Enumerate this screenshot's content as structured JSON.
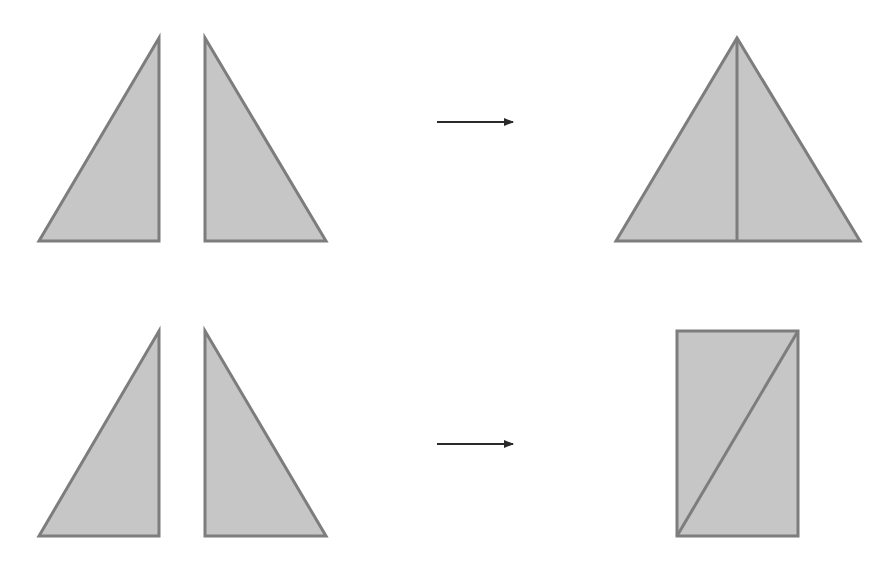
{
  "diagram": {
    "title": "",
    "colors": {
      "background": "#ffffff",
      "fill": "#c6c6c6",
      "stroke": "#7d7d7d",
      "arrow": "#2a2a2a"
    },
    "rows": [
      {
        "name": "row-isosceles",
        "inputs": [
          {
            "name": "left-right-triangle",
            "points": [
              [
                39,
                241
              ],
              [
                159,
                241
              ],
              [
                159,
                38
              ]
            ]
          },
          {
            "name": "right-right-triangle",
            "points": [
              [
                205,
                38
              ],
              [
                205,
                241
              ],
              [
                326,
                241
              ]
            ]
          }
        ],
        "arrow": {
          "x1": 437,
          "y1": 122,
          "x2": 513,
          "y2": 122
        },
        "output": {
          "name": "combined-isosceles-triangle",
          "polygon": [
            [
              616,
              241
            ],
            [
              737,
              38
            ],
            [
              860,
              241
            ]
          ],
          "inner_lines": [
            [
              [
                737,
                38
              ],
              [
                737,
                241
              ]
            ]
          ]
        }
      },
      {
        "name": "row-rectangle",
        "inputs": [
          {
            "name": "left-right-triangle",
            "points": [
              [
                39,
                536
              ],
              [
                159,
                536
              ],
              [
                159,
                331
              ]
            ]
          },
          {
            "name": "right-right-triangle",
            "points": [
              [
                205,
                331
              ],
              [
                205,
                536
              ],
              [
                326,
                536
              ]
            ]
          }
        ],
        "arrow": {
          "x1": 437,
          "y1": 444,
          "x2": 513,
          "y2": 444
        },
        "output": {
          "name": "combined-rectangle",
          "polygon": [
            [
              677,
              331
            ],
            [
              798,
              331
            ],
            [
              798,
              536
            ],
            [
              677,
              536
            ]
          ],
          "inner_lines": [
            [
              [
                677,
                536
              ],
              [
                798,
                331
              ]
            ]
          ]
        }
      }
    ]
  }
}
